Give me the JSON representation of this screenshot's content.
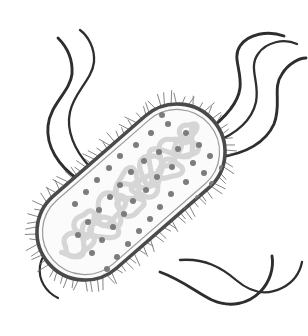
{
  "figure": {
    "title": "Prokaryotic Cell (Bacterium)",
    "type": "scientific-illustration",
    "background_color": "#ffffff",
    "canvas": {
      "width": 308,
      "height": 336
    }
  },
  "cell_body": {
    "name": "bacterial-cell",
    "shape": "capsule",
    "rotation_deg": -41,
    "center": {
      "x": 131,
      "y": 192
    },
    "length": 218,
    "width": 96,
    "corner_radius": 48,
    "cytoplasm_color": "#fbfbfb",
    "cell_wall_color": "#4a4a4a",
    "cell_wall_width": 3.6,
    "inner_membrane_color": "#9a9a9a",
    "inner_membrane_width": 1.2,
    "membrane_gap": 5.5
  },
  "nucleoid": {
    "name": "nucleoid-dna",
    "label": "nucleoid (circular DNA)",
    "color": "#d6d6d6",
    "stroke_width": 5.2,
    "description": "tangled supercoiled circular chromosome"
  },
  "ribosomes": {
    "name": "ribosomes",
    "label": "ribosomes",
    "color": "#7c7c7c",
    "radius": 3.0,
    "count": 56,
    "points": [
      [
        168,
        124
      ],
      [
        186,
        133
      ],
      [
        151,
        133
      ],
      [
        199,
        145
      ],
      [
        178,
        149
      ],
      [
        136,
        145
      ],
      [
        159,
        152
      ],
      [
        210,
        156
      ],
      [
        193,
        163
      ],
      [
        120,
        156
      ],
      [
        144,
        161
      ],
      [
        172,
        167
      ],
      [
        204,
        173
      ],
      [
        109,
        168
      ],
      [
        131,
        172
      ],
      [
        157,
        177
      ],
      [
        186,
        182
      ],
      [
        212,
        184
      ],
      [
        97,
        180
      ],
      [
        120,
        185
      ],
      [
        146,
        190
      ],
      [
        171,
        194
      ],
      [
        198,
        198
      ],
      [
        86,
        192
      ],
      [
        110,
        197
      ],
      [
        133,
        201
      ],
      [
        160,
        207
      ],
      [
        187,
        210
      ],
      [
        209,
        208
      ],
      [
        75,
        204
      ],
      [
        99,
        210
      ],
      [
        124,
        214
      ],
      [
        150,
        219
      ],
      [
        176,
        223
      ],
      [
        198,
        223
      ],
      [
        88,
        222
      ],
      [
        113,
        227
      ],
      [
        139,
        231
      ],
      [
        164,
        236
      ],
      [
        190,
        236
      ],
      [
        78,
        235
      ],
      [
        102,
        240
      ],
      [
        128,
        244
      ],
      [
        153,
        248
      ],
      [
        178,
        247
      ],
      [
        92,
        253
      ],
      [
        117,
        257
      ],
      [
        142,
        261
      ],
      [
        166,
        258
      ],
      [
        107,
        269
      ],
      [
        131,
        272
      ],
      [
        155,
        269
      ],
      [
        120,
        281
      ],
      [
        144,
        280
      ],
      [
        222,
        168
      ],
      [
        162,
        115
      ]
    ]
  },
  "pili": {
    "name": "pili-fimbriae",
    "label": "pili / fimbriae",
    "color": "#6e6e6e",
    "stroke_width": 0.85,
    "count": 96,
    "length_min": 6,
    "length_max": 13
  },
  "flagella": {
    "name": "flagella",
    "label": "flagella",
    "color": "#2e2e2e",
    "count": 7,
    "groups": [
      {
        "name": "flagella-top-right",
        "count": 3,
        "origin_pole": "upper-right"
      },
      {
        "name": "flagella-left",
        "count": 2,
        "origin_pole": "upper-left-side"
      },
      {
        "name": "flagella-bottom-right",
        "count": 2,
        "origin_pole": "lower-right-side"
      }
    ],
    "paths": [
      "M 206,132 C 225,118 238,104 240,88 C 242,70 232,58 240,46 C 248,34 268,30 284,36",
      "M 213,143 C 236,134 252,120 256,102 C 260,82 248,68 258,54 C 266,42 284,38 297,44",
      "M 219,157 C 246,154 266,142 274,124 C 282,104 272,88 282,74 C 288,64 299,58 306,58",
      "M 90,167 C 74,150 66,130 70,112 C 74,92 92,80 94,62 C 95,48 88,36 80,30",
      "M 79,180 C 58,166 46,146 48,126 C 50,104 70,92 72,74 C 73,58 66,46 58,38",
      "M 180,260 C 205,258 222,268 236,280 C 250,292 266,296 282,288 C 294,282 300,272 302,262",
      "M 160,272 C 182,280 196,292 212,300 C 230,308 248,304 260,292 C 270,282 274,268 272,256"
    ],
    "left_lower_path": "M 74,232 C 56,240 42,252 40,266 C 38,280 46,292 58,298"
  },
  "legend": {
    "visible": false,
    "items": []
  }
}
